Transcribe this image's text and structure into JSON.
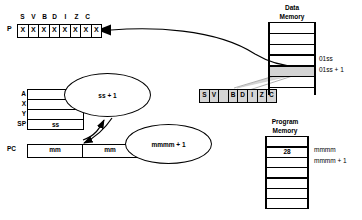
{
  "diagram": {
    "status_register": {
      "name_label": "P",
      "flag_names": [
        "S",
        "V",
        "B",
        "D",
        "I",
        "Z",
        "C"
      ],
      "cells": [
        "X",
        "X",
        "X",
        "X",
        "X",
        "X",
        "X",
        "X"
      ]
    },
    "cpu_registers": {
      "names": [
        "A",
        "X",
        "Y",
        "SP"
      ],
      "values": [
        "",
        "",
        "",
        "ss"
      ],
      "pc_label": "PC",
      "pc_cells": [
        "mm",
        "mm"
      ]
    },
    "floating_flag_register": {
      "cells": [
        "S",
        "V",
        "",
        "B",
        "D",
        "I",
        "Z",
        "C"
      ]
    },
    "bubbles": [
      {
        "text": "ss + 1"
      },
      {
        "text": "mmmm + 1"
      }
    ],
    "data_memory": {
      "title_line1": "Data",
      "title_line2": "Memory",
      "address_labels": [
        "01ss",
        "01ss + 1"
      ],
      "highlighted_cell_value": ""
    },
    "program_memory": {
      "title_line1": "Program",
      "title_line2": "Memory",
      "cell_value": "28",
      "address_labels": [
        "mmmm",
        "mmmm + 1"
      ]
    },
    "colors": {
      "ink": "#000000",
      "paper": "#ffffff",
      "shade": "#d4d4d4"
    }
  }
}
